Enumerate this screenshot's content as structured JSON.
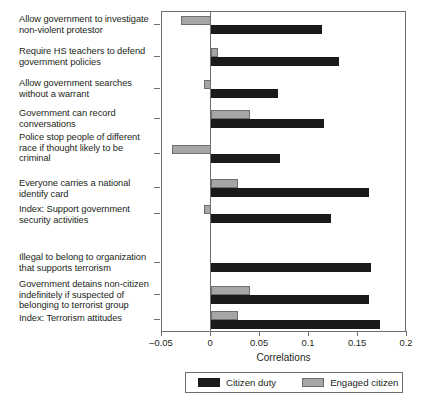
{
  "chart_data": {
    "type": "bar",
    "orientation": "horizontal",
    "title": "",
    "xlabel": "Correlations",
    "ylabel": "",
    "xlim": [
      -0.05,
      0.2
    ],
    "xticks": [
      -0.05,
      0,
      0.05,
      0.1,
      0.15,
      0.2
    ],
    "xticklabels": [
      "–0.05",
      "0",
      "0.05",
      "0.1",
      "0.15",
      "0.2"
    ],
    "grid": false,
    "legend_position": "bottom",
    "categories": [
      "Allow government to investigate non-violent protestor",
      "Require HS teachers to defend government policies",
      "Allow government searches without a warrant",
      "Government can record conversations",
      "Police stop people of different race if thought likely to be criminal",
      "Everyone carries a national identify card",
      "Index: Support government security activities",
      "Illegal to belong to organization that supports terrorism",
      "Government detains non-citizen indefinitely if suspected of belonging to terrorist group",
      "Index: Terrorism attitudes"
    ],
    "series": [
      {
        "name": "Citizen duty",
        "color": "#1a1a1a",
        "values": [
          0.113,
          0.131,
          0.068,
          0.115,
          0.07,
          0.161,
          0.122,
          0.163,
          0.161,
          0.172
        ]
      },
      {
        "name": "Engaged citizen",
        "color": "#a6a6a6",
        "values": [
          -0.031,
          0.007,
          -0.007,
          0.04,
          -0.04,
          0.028,
          -0.007,
          0.0,
          0.04,
          0.028
        ]
      }
    ]
  },
  "labels": {
    "categories": [
      {
        "lines": [
          "Allow government to investigate",
          "non-violent protestor"
        ]
      },
      {
        "lines": [
          "Require HS teachers to defend",
          "government policies"
        ]
      },
      {
        "lines": [
          "Allow government searches",
          "without a warrant"
        ]
      },
      {
        "lines": [
          "Government can record",
          "conversations"
        ]
      },
      {
        "lines": [
          "Police stop people of different",
          "race if thought likely to be",
          "criminal"
        ]
      },
      {
        "lines": [
          "Everyone carries a national",
          "identify card"
        ]
      },
      {
        "lines": [
          "Index: Support government",
          "security activities"
        ]
      },
      {
        "lines": [
          "Illegal to belong to organization",
          "that supports terrorism"
        ]
      },
      {
        "lines": [
          "Government detains non-citizen",
          "indefinitely if suspected of",
          "belonging to terrorist group"
        ]
      },
      {
        "lines": [
          "Index: Terrorism attitudes"
        ]
      }
    ]
  },
  "axis": {
    "title": "Correlations",
    "ticklabels": [
      "–0.05",
      "0",
      "0.05",
      "0.1",
      "0.15",
      "0.2"
    ]
  },
  "legend": {
    "items": [
      {
        "label": "Citizen duty",
        "color": "#1a1a1a"
      },
      {
        "label": "Engaged citizen",
        "color": "#a6a6a6"
      }
    ]
  }
}
